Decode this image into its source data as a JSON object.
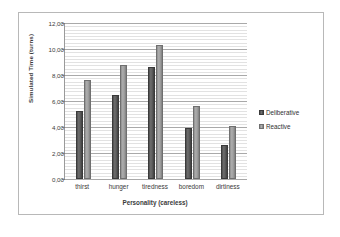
{
  "chart_data": {
    "type": "bar",
    "title": "",
    "xlabel": "Personality (careless)",
    "ylabel": "Simulated Time (turns)",
    "categories": [
      "thirst",
      "hunger",
      "tiredness",
      "boredom",
      "dirtiness"
    ],
    "series": [
      {
        "name": "Deliberative",
        "values": [
          5.2,
          6.5,
          8.6,
          3.9,
          2.6
        ],
        "color": "#5a5a5a"
      },
      {
        "name": "Reactive",
        "values": [
          7.6,
          8.8,
          10.3,
          5.6,
          4.05
        ],
        "color": "#9e9e9e"
      }
    ],
    "ylim": [
      0,
      12
    ],
    "ytick_step": 2,
    "ytick_labels": [
      "0,00",
      "2,00",
      "4,00",
      "6,00",
      "8,00",
      "10,00",
      "12,00"
    ],
    "ytick_values": [
      0,
      2,
      4,
      6,
      8,
      10,
      12
    ],
    "minor_gridline_step": 0.25,
    "grid": true,
    "legend_position": "right"
  },
  "legend": {
    "entries": [
      {
        "label": "Deliberative"
      },
      {
        "label": "Reactive"
      }
    ]
  }
}
